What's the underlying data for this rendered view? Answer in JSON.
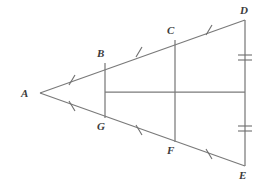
{
  "figure": {
    "stroke_color": "#7a7a7a",
    "tick_color": "#6d6d6d",
    "label_color": "#3b3b3b",
    "background_color": "#ffffff"
  },
  "vertices": {
    "A": {
      "label": "A",
      "x": 40,
      "y": 93,
      "label_x": 21,
      "label_y": 88
    },
    "B": {
      "label": "B",
      "x": 105,
      "y": 63,
      "label_x": 97,
      "label_y": 48
    },
    "C": {
      "label": "C",
      "x": 175,
      "y": 40,
      "label_x": 167,
      "label_y": 25
    },
    "D": {
      "label": "D",
      "x": 245,
      "y": 20,
      "label_x": 240,
      "label_y": 5
    },
    "E": {
      "label": "E",
      "x": 245,
      "y": 166,
      "label_x": 239,
      "label_y": 170
    },
    "F": {
      "label": "F",
      "x": 175,
      "y": 142,
      "label_x": 167,
      "label_y": 145
    },
    "G": {
      "label": "G",
      "x": 105,
      "y": 118,
      "label_x": 97,
      "label_y": 121
    }
  },
  "segments": [
    {
      "name": "A-D-upper-side",
      "from": "A",
      "to": "D",
      "points": "40,93 245,20"
    },
    {
      "name": "A-E-lower-side",
      "from": "A",
      "to": "E",
      "points": "40,93 245,166"
    },
    {
      "name": "D-E-right-side",
      "from": "D",
      "to": "E",
      "points": "245,20 245,166"
    },
    {
      "name": "B-G-vertical",
      "from": "B",
      "to": "G",
      "points": "105,63 105,118"
    },
    {
      "name": "C-F-vertical",
      "from": "C",
      "to": "F",
      "points": "175,40 175,142"
    },
    {
      "name": "midline-horizontal",
      "from": "B-G midpoint",
      "to": "D-E midpoint",
      "points": "105,92 245,92"
    }
  ],
  "tick_marks": [
    {
      "name": "tick-AB",
      "on": "AB",
      "count": 1,
      "cx": 72,
      "cy": 80
    },
    {
      "name": "tick-BC",
      "on": "BC",
      "count": 1,
      "cx": 139,
      "cy": 52
    },
    {
      "name": "tick-CD",
      "on": "CD",
      "count": 1,
      "cx": 209,
      "cy": 30
    },
    {
      "name": "tick-AG",
      "on": "AG",
      "count": 1,
      "cx": 72,
      "cy": 106
    },
    {
      "name": "tick-GF",
      "on": "GF",
      "count": 1,
      "cx": 139,
      "cy": 130
    },
    {
      "name": "tick-FE",
      "on": "FE",
      "count": 1,
      "cx": 209,
      "cy": 154
    },
    {
      "name": "tick-DE-upper",
      "on": "DE upper half",
      "count": 2,
      "cx": 245,
      "cy": 57
    },
    {
      "name": "tick-DE-lower",
      "on": "DE lower half",
      "count": 2,
      "cx": 245,
      "cy": 128
    }
  ]
}
